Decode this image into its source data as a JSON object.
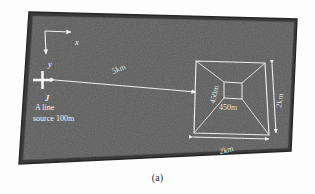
{
  "figure": {
    "caption": "(a)"
  },
  "axes": {
    "x_label": "x",
    "y_label": "y"
  },
  "source": {
    "marker": "cross-marker",
    "symbol": "J",
    "line1": "A line",
    "line2": "source 100m"
  },
  "distance": {
    "source_to_body": "5km"
  },
  "body": {
    "top_width": "2km",
    "side_depth": "2km",
    "inner_width": "450m",
    "inner_depth": "450m"
  },
  "colors": {
    "slab_fill": "#5a5a5a",
    "slab_edge": "#2e2e2e",
    "annotation": "#eeeeee",
    "background": "#fdfdfd"
  }
}
